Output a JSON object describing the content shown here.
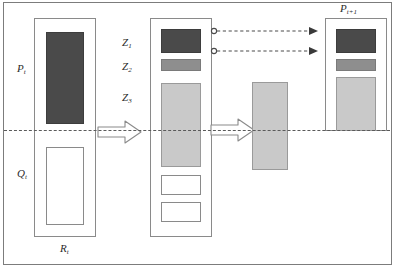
{
  "figure": {
    "type": "schematic-diagram",
    "background": "#ffffff",
    "frame_color": "#7c7c7c",
    "baseline_label": "reference-dashed-line"
  },
  "colors": {
    "dark_fill": "#4a4a4a",
    "mid_fill": "#8e8e8e",
    "light_fill": "#c9c9c9",
    "empty_fill": "#ffffff",
    "stroke": "#8a8a8a",
    "dash_stroke": "#5a5a5a"
  },
  "labels": {
    "p_t": "P",
    "p_t_sub": "t",
    "q_t": "Q",
    "q_t_sub": "t",
    "r_t": "R",
    "r_t_sub": "t",
    "z1": "Z",
    "z1_sub": "1",
    "z2": "Z",
    "z2_sub": "2",
    "z3": "Z",
    "z3_sub": "3",
    "p_t1": "P",
    "p_t1_sub": "t+1"
  },
  "columns": {
    "left": {
      "name": "P_t column",
      "bars": [
        {
          "id": "p-t-bar",
          "fill": "dark",
          "position": "above-baseline"
        },
        {
          "id": "q-t-bar",
          "fill": "empty",
          "position": "below-baseline"
        }
      ]
    },
    "middle": {
      "name": "Z decomposition column",
      "bars": [
        {
          "id": "z1-bar",
          "fill": "dark",
          "position": "above-baseline"
        },
        {
          "id": "z2-bar",
          "fill": "mid",
          "position": "above-baseline"
        },
        {
          "id": "z3-bar",
          "fill": "light",
          "position": "crosses-baseline"
        },
        {
          "id": "empty-box-1",
          "fill": "empty",
          "position": "below-baseline"
        },
        {
          "id": "empty-box-2",
          "fill": "empty",
          "position": "below-baseline"
        }
      ]
    },
    "intermediate": {
      "name": "standalone transferred bar",
      "bars": [
        {
          "id": "transfer-bar",
          "fill": "light",
          "position": "crosses-baseline"
        }
      ]
    },
    "right": {
      "name": "P_t+1 column",
      "bars": [
        {
          "id": "p-next-dark-bar",
          "fill": "dark",
          "position": "above-baseline"
        },
        {
          "id": "p-next-mid-bar",
          "fill": "mid",
          "position": "above-baseline"
        },
        {
          "id": "p-next-light-bar",
          "fill": "light",
          "position": "above-baseline"
        }
      ]
    }
  },
  "arrows": {
    "block": [
      {
        "id": "block-arrow-1",
        "direction": "right"
      },
      {
        "id": "block-arrow-2",
        "direction": "right"
      }
    ],
    "dashed": [
      {
        "id": "dashed-arrow-top",
        "direction": "right",
        "tail": "circle",
        "head": "filled"
      },
      {
        "id": "dashed-arrow-bottom",
        "direction": "right",
        "tail": "circle",
        "head": "filled"
      }
    ]
  }
}
